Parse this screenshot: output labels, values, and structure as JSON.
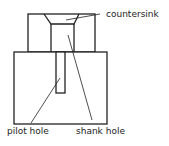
{
  "diagram": {
    "labels": {
      "countersink": "countersink",
      "pilot_hole": "pilot hole",
      "shank_hole": "shank hole"
    },
    "colors": {
      "stroke": "#222222",
      "background": "#ffffff"
    }
  }
}
